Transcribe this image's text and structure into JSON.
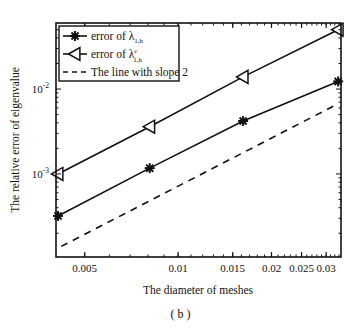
{
  "chart_data": {
    "type": "line",
    "title": "",
    "caption": "( b )",
    "xlabel": "The diameter of meshes",
    "ylabel": "The relative error of eigenvalue",
    "xscale": "log",
    "yscale": "log",
    "xlim": [
      0.00404,
      0.0335
    ],
    "ylim": [
      0.000105,
      0.06
    ],
    "grid": false,
    "legend_position": "upper left",
    "x_ticks": [
      {
        "value": 0.005,
        "label": "0.005"
      },
      {
        "value": 0.01,
        "label": "0.01"
      },
      {
        "value": 0.015,
        "label": "0.015"
      },
      {
        "value": 0.02,
        "label": "0.02"
      },
      {
        "value": 0.025,
        "label": "0.025"
      },
      {
        "value": 0.03,
        "label": "0.03"
      }
    ],
    "y_ticks": [
      {
        "value": 0.001,
        "base": "10",
        "exp": "-3"
      },
      {
        "value": 0.01,
        "base": "10",
        "exp": "-2"
      }
    ],
    "series": [
      {
        "name": "error of λ_{1,h}",
        "legend_main": "error of λ",
        "legend_sub": "1,h",
        "legend_sup": "",
        "marker": "star",
        "linestyle": "solid",
        "x": [
          0.0041,
          0.0081,
          0.0162,
          0.0328
        ],
        "values": [
          0.00032,
          0.00117,
          0.0042,
          0.0123
        ]
      },
      {
        "name": "error of λ^c_{1,h}",
        "legend_main": "error of λ",
        "legend_sub": "1,h",
        "legend_sup": "c",
        "marker": "triangle-left",
        "linestyle": "solid",
        "x": [
          0.0041,
          0.0081,
          0.0162,
          0.0328
        ],
        "values": [
          0.001,
          0.0036,
          0.0139,
          0.05
        ]
      },
      {
        "name": "The line with slope 2",
        "legend_main": "The line with slope 2",
        "legend_sub": "",
        "legend_sup": "",
        "marker": "none",
        "linestyle": "dashed",
        "x": [
          0.0042,
          0.0325
        ],
        "values": [
          0.00014,
          0.0066
        ]
      }
    ]
  }
}
